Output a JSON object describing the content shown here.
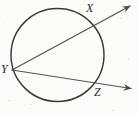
{
  "figure": {
    "background_color": "#fbfbfa",
    "stroke_color": "#3a3a3a",
    "label_color": "#2b2b2b",
    "labels": {
      "x": "X",
      "y": "Y",
      "z": "Z"
    },
    "circle": {
      "center_x": 57.5,
      "center_y": 55,
      "radius": 46.5
    },
    "points": {
      "X": {
        "x": 93,
        "y": 19
      },
      "Y": {
        "x": 12,
        "y": 70
      },
      "Z": {
        "x": 98,
        "y": 85
      }
    },
    "rays": [
      {
        "name": "ray-YX",
        "from_x": 12,
        "from_y": 70,
        "through_x": 93,
        "through_y": 19,
        "tip_x": 132,
        "tip_y": 5,
        "arrowhead": "open-right-up"
      },
      {
        "name": "ray-YZ",
        "from_x": 12,
        "from_y": 70,
        "through_x": 98,
        "through_y": 85,
        "tip_x": 133,
        "tip_y": 89,
        "arrowhead": "open-right"
      }
    ]
  }
}
